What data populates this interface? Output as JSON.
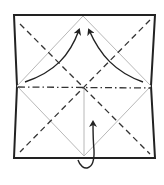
{
  "diagram": {
    "elements": {
      "paper": "square-sheet",
      "creases": [
        "diamond-crease",
        "vertical-center-crease"
      ],
      "valley_folds": [
        "diagonal-valley-fold-1",
        "diagonal-valley-fold-2"
      ],
      "mountain_folds": [
        "horizontal-mountain-fold"
      ],
      "arrows": [
        "fold-arrow-left",
        "fold-arrow-right",
        "fold-behind-arrow-bottom"
      ]
    },
    "colors": {
      "outline": "#222222",
      "crease": "#b8b8b8",
      "fold_line": "#333333",
      "arrow": "#222222"
    }
  }
}
